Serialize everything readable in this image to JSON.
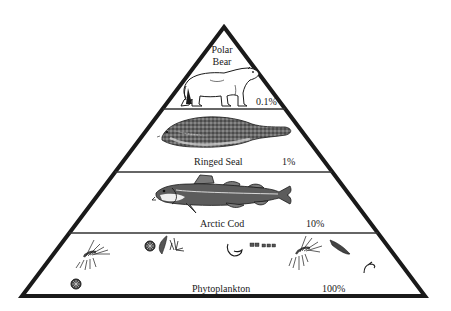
{
  "diagram": {
    "type": "ecological-pyramid",
    "colors": {
      "outline": "#1a1a1a",
      "fill": "#ffffff",
      "divider": "#333333"
    },
    "levels": [
      {
        "name_line1": "Polar",
        "name_line2": "Bear",
        "name": "Polar Bear",
        "percent": "0.1%",
        "illustration": "polar-bear"
      },
      {
        "name": "Ringed Seal",
        "percent": "1%",
        "illustration": "ringed-seal"
      },
      {
        "name": "Arctic Cod",
        "percent": "10%",
        "illustration": "arctic-cod"
      },
      {
        "name": "Phytoplankton",
        "percent": "100%",
        "illustration": "phytoplankton"
      }
    ]
  }
}
